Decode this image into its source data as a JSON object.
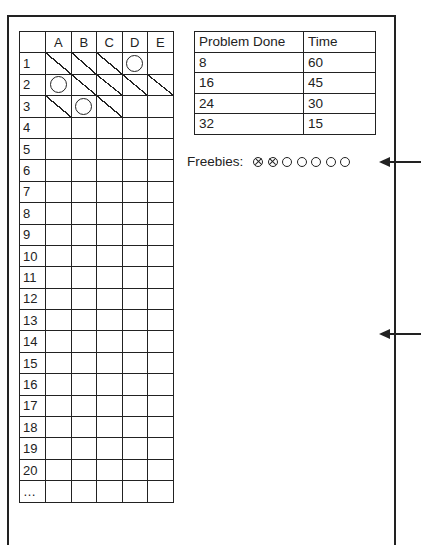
{
  "grid": {
    "columns": [
      "",
      "A",
      "B",
      "C",
      "D",
      "E"
    ],
    "rows": [
      {
        "label": "1",
        "cells": [
          "slash",
          "slash",
          "slash",
          "circle",
          ""
        ]
      },
      {
        "label": "2",
        "cells": [
          "circle",
          "slash",
          "slash",
          "slash",
          "slash"
        ]
      },
      {
        "label": "3",
        "cells": [
          "slash",
          "circle",
          "slash",
          "",
          ""
        ]
      },
      {
        "label": "4",
        "cells": [
          "",
          "",
          "",
          "",
          ""
        ]
      },
      {
        "label": "5",
        "cells": [
          "",
          "",
          "",
          "",
          ""
        ]
      },
      {
        "label": "6",
        "cells": [
          "",
          "",
          "",
          "",
          ""
        ]
      },
      {
        "label": "7",
        "cells": [
          "",
          "",
          "",
          "",
          ""
        ]
      },
      {
        "label": "8",
        "cells": [
          "",
          "",
          "",
          "",
          ""
        ]
      },
      {
        "label": "9",
        "cells": [
          "",
          "",
          "",
          "",
          ""
        ]
      },
      {
        "label": "10",
        "cells": [
          "",
          "",
          "",
          "",
          ""
        ]
      },
      {
        "label": "11",
        "cells": [
          "",
          "",
          "",
          "",
          ""
        ]
      },
      {
        "label": "12",
        "cells": [
          "",
          "",
          "",
          "",
          ""
        ]
      },
      {
        "label": "13",
        "cells": [
          "",
          "",
          "",
          "",
          ""
        ]
      },
      {
        "label": "14",
        "cells": [
          "",
          "",
          "",
          "",
          ""
        ]
      },
      {
        "label": "15",
        "cells": [
          "",
          "",
          "",
          "",
          ""
        ]
      },
      {
        "label": "16",
        "cells": [
          "",
          "",
          "",
          "",
          ""
        ]
      },
      {
        "label": "17",
        "cells": [
          "",
          "",
          "",
          "",
          ""
        ]
      },
      {
        "label": "18",
        "cells": [
          "",
          "",
          "",
          "",
          ""
        ]
      },
      {
        "label": "19",
        "cells": [
          "",
          "",
          "",
          "",
          ""
        ]
      },
      {
        "label": "20",
        "cells": [
          "",
          "",
          "",
          "",
          ""
        ]
      },
      {
        "label": "…",
        "cells": [
          "",
          "",
          "",
          "",
          ""
        ]
      }
    ]
  },
  "progress_table": {
    "headers": [
      "Problem Done",
      "Time"
    ],
    "rows": [
      [
        "8",
        "60"
      ],
      [
        "16",
        "45"
      ],
      [
        "24",
        "30"
      ],
      [
        "32",
        "15"
      ]
    ]
  },
  "freebies": {
    "label": "Freebies:",
    "tokens": [
      "used",
      "used",
      "unused",
      "unused",
      "unused",
      "unused",
      "unused"
    ]
  },
  "arrows": [
    {
      "y": 162
    },
    {
      "y": 334
    }
  ],
  "colors": {
    "ink": "#222222",
    "background": "#ffffff"
  }
}
